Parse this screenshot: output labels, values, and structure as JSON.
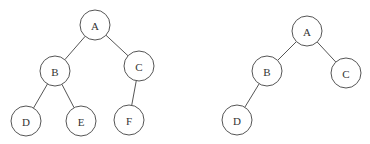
{
  "trees": [
    {
      "name": "left-tree",
      "nodes": [
        {
          "id": "A",
          "label": "A",
          "x": 95,
          "y": 25
        },
        {
          "id": "B",
          "label": "B",
          "x": 55,
          "y": 71
        },
        {
          "id": "C",
          "label": "C",
          "x": 139,
          "y": 66
        },
        {
          "id": "D",
          "label": "D",
          "x": 26,
          "y": 121
        },
        {
          "id": "E",
          "label": "E",
          "x": 81,
          "y": 121
        },
        {
          "id": "F",
          "label": "F",
          "x": 129,
          "y": 120
        }
      ],
      "edges": [
        [
          "A",
          "B"
        ],
        [
          "A",
          "C"
        ],
        [
          "B",
          "D"
        ],
        [
          "B",
          "E"
        ],
        [
          "C",
          "F"
        ]
      ]
    },
    {
      "name": "right-tree",
      "nodes": [
        {
          "id": "A",
          "label": "A",
          "x": 307,
          "y": 31
        },
        {
          "id": "B",
          "label": "B",
          "x": 267,
          "y": 71
        },
        {
          "id": "C",
          "label": "C",
          "x": 346,
          "y": 73
        },
        {
          "id": "D",
          "label": "D",
          "x": 237,
          "y": 120
        }
      ],
      "edges": [
        [
          "A",
          "B"
        ],
        [
          "A",
          "C"
        ],
        [
          "B",
          "D"
        ]
      ]
    }
  ],
  "node_radius": 15
}
